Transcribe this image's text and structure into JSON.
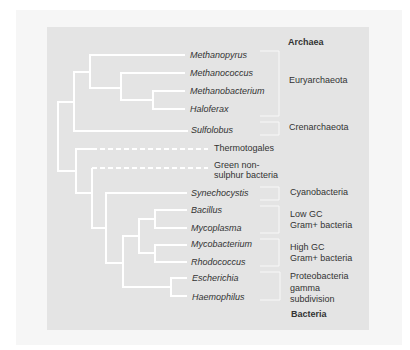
{
  "diagram": {
    "type": "phylogenetic-tree",
    "domains": {
      "archaea": "Archaea",
      "bacteria": "Bacteria"
    },
    "taxa": [
      {
        "name": "Methanopyrus",
        "italic": true
      },
      {
        "name": "Methanococcus",
        "italic": true
      },
      {
        "name": "Methanobacterium",
        "italic": true
      },
      {
        "name": "Haloferax",
        "italic": true
      },
      {
        "name": "Sulfolobus",
        "italic": true
      },
      {
        "name": "Thermotogales",
        "italic": false
      },
      {
        "name": "Green non-",
        "italic": false
      },
      {
        "name": "sulphur bacteria",
        "italic": false
      },
      {
        "name": "Synechocystis",
        "italic": true
      },
      {
        "name": "Bacillus",
        "italic": true
      },
      {
        "name": "Mycoplasma",
        "italic": true
      },
      {
        "name": "Mycobacterium",
        "italic": true
      },
      {
        "name": "Rhodococcus",
        "italic": true
      },
      {
        "name": "Escherichia",
        "italic": true
      },
      {
        "name": "Haemophilus",
        "italic": true
      }
    ],
    "groups": [
      {
        "lines": [
          "Euryarchaeota"
        ]
      },
      {
        "lines": [
          "Crenarchaeota"
        ]
      },
      {
        "lines": [
          "Cyanobacteria"
        ]
      },
      {
        "lines": [
          "Low GC",
          "Gram+ bacteria"
        ]
      },
      {
        "lines": [
          "High GC",
          "Gram+ bacteria"
        ]
      },
      {
        "lines": [
          "Proteobacteria",
          "gamma",
          "subdivision"
        ]
      }
    ],
    "colors": {
      "panel": "#e4e4e4",
      "branch": "#ffffff",
      "text": "#333333"
    }
  }
}
